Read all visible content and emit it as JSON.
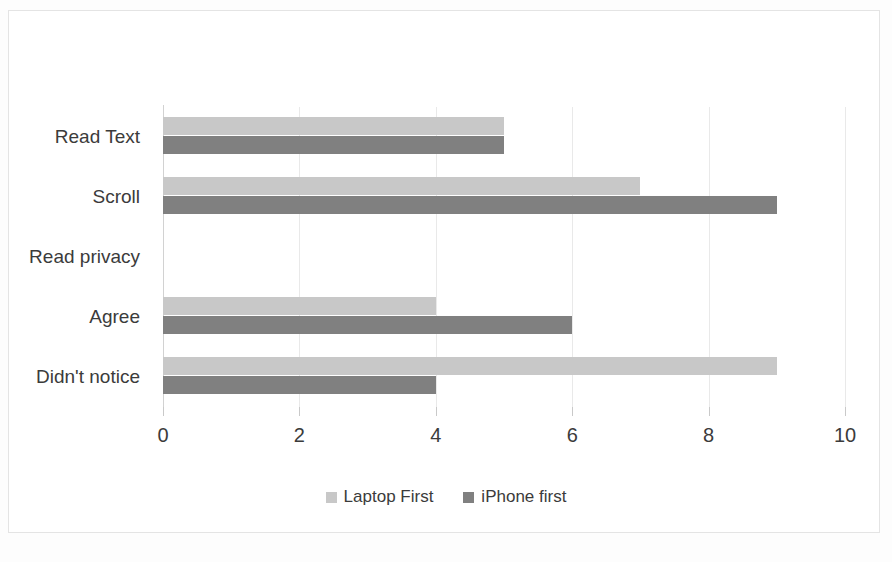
{
  "chart_data": {
    "type": "bar",
    "orientation": "horizontal",
    "title": "",
    "xlabel": "",
    "ylabel": "",
    "categories": [
      "Read Text",
      "Scroll",
      "Read privacy",
      "Agree",
      "Didn't notice"
    ],
    "series": [
      {
        "name": "Laptop First",
        "color": "#c8c8c8",
        "values": [
          5,
          7,
          0,
          4,
          9
        ]
      },
      {
        "name": "iPhone first",
        "color": "#808080",
        "values": [
          5,
          9,
          0,
          6,
          4
        ]
      }
    ],
    "xlim": [
      0,
      10
    ],
    "xticks": [
      0,
      2,
      4,
      6,
      8,
      10
    ],
    "xtick_labels": [
      "0",
      "2",
      "4",
      "6",
      "8",
      "10"
    ],
    "grid": true,
    "grid_axis": "x",
    "legend": true,
    "legend_position": "bottom",
    "legend_entries": [
      "Laptop First",
      "iPhone first"
    ],
    "annotations": []
  }
}
